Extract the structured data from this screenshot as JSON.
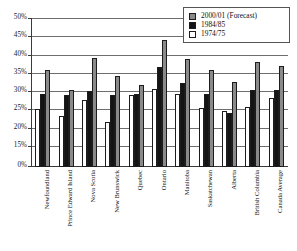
{
  "chart_data": {
    "type": "bar",
    "title": "",
    "subtitle": "",
    "xlabel": "",
    "ylabel": "",
    "ylim": [
      15,
      50
    ],
    "axis_break_from_zero": true,
    "ytick_labels": [
      "50%",
      "45%",
      "40%",
      "35%",
      "30%",
      "25%",
      "20%",
      "15%",
      "0%"
    ],
    "ytick_values": [
      50,
      45,
      40,
      35,
      30,
      25,
      20,
      15,
      0
    ],
    "grid": true,
    "grid_axis": "y",
    "legend_position": "top-right",
    "categories": [
      "Newfoundland",
      "Prince Edward Island",
      "Nova Scotia",
      "New Brunswick",
      "Quebec",
      "Ontario",
      "Manitoba",
      "Saskatchewan",
      "Alberta",
      "British Columbia",
      "Canada Average"
    ],
    "series": [
      {
        "name": "1974/75",
        "color": "#ffffff",
        "order_in_group": 1,
        "values": [
          25.0,
          23.2,
          27.6,
          21.5,
          29.0,
          30.7,
          29.1,
          25.3,
          24.5,
          25.8,
          28.1
        ]
      },
      {
        "name": "1984/85",
        "color": "#141414",
        "order_in_group": 2,
        "values": [
          29.1,
          29.0,
          30.1,
          29.0,
          29.1,
          36.6,
          32.1,
          29.1,
          24.1,
          30.4,
          30.4
        ]
      },
      {
        "name": "2000/01 (Forecast)",
        "color": "#8a8a8a",
        "order_in_group": 3,
        "values": [
          35.8,
          30.4,
          39.1,
          34.1,
          31.6,
          43.9,
          38.8,
          35.8,
          32.4,
          37.9,
          37.0
        ]
      }
    ]
  },
  "legend": {
    "items": [
      {
        "label": "2000/01 (Forecast)",
        "swatch": "s2000"
      },
      {
        "label": "1984/85",
        "swatch": "s1984"
      },
      {
        "label": "1974/75",
        "swatch": "s1974"
      }
    ]
  }
}
